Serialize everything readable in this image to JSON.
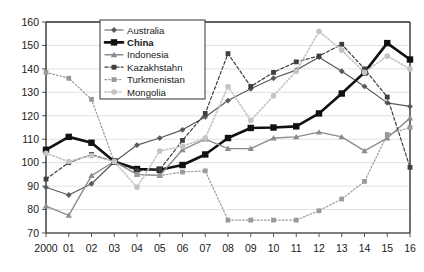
{
  "chart_data": {
    "type": "line",
    "title": "",
    "xlabel": "",
    "ylabel": "",
    "ylim": [
      70,
      160
    ],
    "ytick_step": 10,
    "yticks": [
      "70",
      "80",
      "90",
      "100",
      "110",
      "120",
      "130",
      "140",
      "150",
      "160"
    ],
    "grid": true,
    "legend_position": "top-center-inside",
    "x": [
      2000,
      2001,
      2002,
      2003,
      2004,
      2005,
      2006,
      2007,
      2008,
      2009,
      2010,
      2011,
      2012,
      2013,
      2014,
      2015,
      2016
    ],
    "categories": [
      "2000",
      "01",
      "02",
      "03",
      "04",
      "05",
      "06",
      "07",
      "08",
      "09",
      "10",
      "11",
      "12",
      "13",
      "14",
      "15",
      "16"
    ],
    "series": [
      {
        "name": "Australia",
        "color": "#595959",
        "marker": "diamond",
        "dash": "solid",
        "width": 1.2,
        "values": [
          89.5,
          86.2,
          91.0,
          100.3,
          107.5,
          110.5,
          114.0,
          119.5,
          126.5,
          131.5,
          136.0,
          139.5,
          145.0,
          139.0,
          132.5,
          125.5,
          124.0
        ]
      },
      {
        "name": "China",
        "color": "#111111",
        "marker": "square",
        "dash": "solid",
        "width": 2.6,
        "values": [
          105.5,
          111.0,
          108.5,
          100.5,
          97.3,
          97.0,
          99.0,
          103.5,
          110.5,
          114.8,
          115.0,
          115.5,
          121.0,
          129.5,
          138.5,
          151.0,
          144.0
        ]
      },
      {
        "name": "Indonesia",
        "color": "#8c8c8c",
        "marker": "triangle",
        "dash": "solid",
        "width": 1.4,
        "values": [
          81.5,
          77.5,
          94.5,
          100.5,
          95.0,
          94.5,
          105.5,
          110.0,
          106.0,
          106.0,
          110.5,
          111.0,
          113.0,
          111.0,
          105.0,
          110.5,
          119.0
        ]
      },
      {
        "name": "Kazakhstahn",
        "color": "#3f3f3f",
        "marker": "square",
        "dash": "dashed",
        "width": 1.2,
        "values": [
          93.0,
          100.0,
          103.5,
          100.5,
          96.5,
          97.0,
          109.5,
          121.0,
          146.5,
          132.5,
          138.5,
          143.0,
          145.5,
          150.5,
          140.0,
          128.0,
          98.0
        ]
      },
      {
        "name": "Turkmenistan",
        "color": "#9a9a9a",
        "marker": "square",
        "dash": "dotted",
        "width": 1.2,
        "values": [
          138.5,
          136.0,
          127.0,
          100.5,
          95.0,
          94.5,
          96.0,
          96.5,
          75.5,
          75.5,
          75.5,
          75.5,
          79.5,
          84.5,
          92.0,
          112.0,
          115.0
        ]
      },
      {
        "name": "Mongolia",
        "color": "#c4c4c4",
        "marker": "circle",
        "dash": "dotted",
        "width": 1.6,
        "values": [
          104.0,
          100.5,
          103.0,
          100.5,
          89.5,
          105.0,
          107.0,
          110.5,
          132.5,
          118.0,
          128.5,
          139.0,
          156.0,
          148.0,
          138.5,
          145.5,
          140.0
        ]
      }
    ]
  },
  "legend": {
    "items": [
      {
        "label": "Australia"
      },
      {
        "label": "China"
      },
      {
        "label": "Indonesia"
      },
      {
        "label": "Kazakhstahn"
      },
      {
        "label": "Turkmenistan"
      },
      {
        "label": "Mongolia"
      }
    ]
  }
}
